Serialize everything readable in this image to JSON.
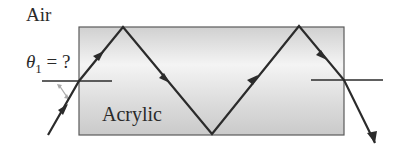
{
  "diagram": {
    "labels": {
      "medium_outside": "Air",
      "medium_inside": "Acrylic",
      "angle_symbol": "θ",
      "angle_subscript": "1",
      "angle_question": " = ?"
    },
    "colors": {
      "ray": "#2b2b2b",
      "slab_fill_light": "#f2f2f2",
      "slab_fill_dark": "#cfcfcf",
      "slab_border": "#555555",
      "angle_marker": "#a9a9a9"
    },
    "slab": {
      "x": 79,
      "y": 27,
      "width": 265,
      "height": 108
    },
    "ray_path": [
      [
        48,
        135
      ],
      [
        79,
        81
      ],
      [
        123,
        27
      ],
      [
        212,
        134
      ],
      [
        299,
        26
      ],
      [
        344,
        80
      ],
      [
        375,
        143
      ]
    ],
    "normals": [
      {
        "x1": 42,
        "x2": 112,
        "y": 81
      },
      {
        "x1": 311,
        "x2": 383,
        "y": 80
      }
    ]
  }
}
